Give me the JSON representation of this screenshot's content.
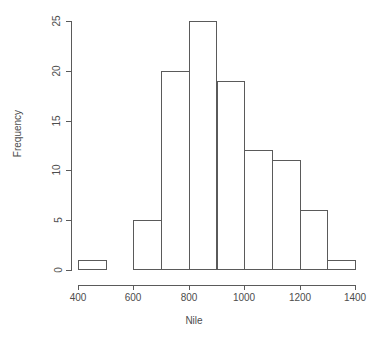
{
  "chart_data": {
    "type": "bar",
    "title": "",
    "xlabel": "Nile",
    "ylabel": "Frequency",
    "categories": [
      "400-500",
      "500-600",
      "600-700",
      "700-800",
      "800-900",
      "900-1000",
      "1000-1100",
      "1100-1200",
      "1200-1300",
      "1300-1400"
    ],
    "bin_edges": [
      400,
      500,
      600,
      700,
      800,
      900,
      1000,
      1100,
      1200,
      1300,
      1400
    ],
    "values": [
      1,
      0,
      5,
      20,
      25,
      19,
      12,
      11,
      6,
      1
    ],
    "bins": [
      {
        "from": 400,
        "to": 500,
        "frequency": 1
      },
      {
        "from": 500,
        "to": 600,
        "frequency": 0
      },
      {
        "from": 600,
        "to": 700,
        "frequency": 5
      },
      {
        "from": 700,
        "to": 800,
        "frequency": 20
      },
      {
        "from": 800,
        "to": 900,
        "frequency": 25
      },
      {
        "from": 900,
        "to": 1000,
        "frequency": 19
      },
      {
        "from": 1000,
        "to": 1100,
        "frequency": 12
      },
      {
        "from": 1100,
        "to": 1200,
        "frequency": 11
      },
      {
        "from": 1200,
        "to": 1300,
        "frequency": 6
      },
      {
        "from": 1300,
        "to": 1400,
        "frequency": 1
      }
    ],
    "xlim": [
      400,
      1400
    ],
    "ylim": [
      0,
      25
    ],
    "xticks": [
      400,
      600,
      800,
      1000,
      1200,
      1400
    ],
    "yticks": [
      0,
      5,
      10,
      15,
      20,
      25
    ],
    "xtick_labels": [
      "400",
      "600",
      "800",
      "1000",
      "1200",
      "1400"
    ],
    "ytick_labels": [
      "0",
      "5",
      "10",
      "15",
      "20",
      "25"
    ],
    "grid": false,
    "legend": null,
    "bar_fill": "#ffffff",
    "bar_stroke": "#5a5a5a",
    "axis_color": "#5a5a5a",
    "text_color": "#4d4d4d",
    "background": "#ffffff"
  }
}
